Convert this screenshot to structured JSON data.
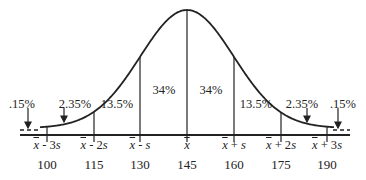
{
  "diagram": {
    "percentages": [
      {
        "label": ".15%",
        "x": 22,
        "y": 97
      },
      {
        "label": "2.35%",
        "x": 75,
        "y": 97
      },
      {
        "label": "13.5%",
        "x": 117,
        "y": 97
      },
      {
        "label": "34%",
        "x": 164,
        "y": 83
      },
      {
        "label": "34%",
        "x": 211,
        "y": 83
      },
      {
        "label": "13.5%",
        "x": 256,
        "y": 97
      },
      {
        "label": "2.35%",
        "x": 302,
        "y": 97
      },
      {
        "label": ".15%",
        "x": 343,
        "y": 97
      }
    ],
    "ticks": [
      {
        "mean": "x",
        "suffix": " - 3s",
        "value": "100",
        "x": 47
      },
      {
        "mean": "x",
        "suffix": " - 2s",
        "value": "115",
        "x": 94
      },
      {
        "mean": "x",
        "suffix": " - s",
        "value": "130",
        "x": 140
      },
      {
        "mean": "x",
        "suffix": "",
        "value": "145",
        "x": 187
      },
      {
        "mean": "x",
        "suffix": " + s",
        "value": "160",
        "x": 234
      },
      {
        "mean": "x",
        "suffix": " + 2s",
        "value": "175",
        "x": 281
      },
      {
        "mean": "x",
        "suffix": " + 3s",
        "value": "190",
        "x": 327
      }
    ],
    "colors": {
      "line": "#222222",
      "background": "#ffffff"
    }
  }
}
